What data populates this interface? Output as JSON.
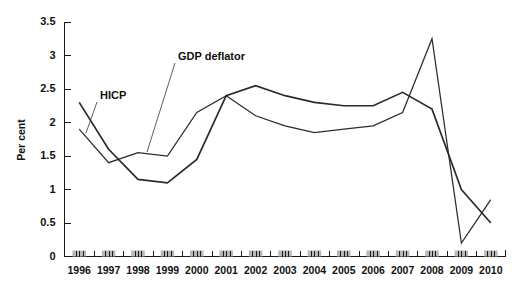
{
  "chart_data": {
    "type": "line",
    "title": "",
    "xlabel": "",
    "ylabel": "Per cent",
    "ylim": [
      0,
      3.5
    ],
    "yticks": [
      "0",
      "0.5",
      "1",
      "1.5",
      "2",
      "2.5",
      "3",
      "3.5"
    ],
    "ytick_values": [
      0,
      0.5,
      1,
      1.5,
      2,
      2.5,
      3,
      3.5
    ],
    "grid": false,
    "legend_position": "inline-annotations",
    "categories": [
      "1996",
      "1997",
      "1998",
      "1999",
      "2000",
      "2001",
      "2002",
      "2003",
      "2004",
      "2005",
      "2006",
      "2007",
      "2008",
      "2009",
      "2010"
    ],
    "series": [
      {
        "name": "HICP",
        "values": [
          2.3,
          1.6,
          1.15,
          1.1,
          1.45,
          2.4,
          2.55,
          2.4,
          2.3,
          2.25,
          2.25,
          2.45,
          2.2,
          1.0,
          0.5
        ]
      },
      {
        "name": "GDP deflator",
        "values": [
          1.9,
          1.4,
          1.55,
          1.5,
          2.15,
          2.4,
          2.1,
          1.95,
          1.85,
          1.9,
          1.95,
          2.15,
          3.25,
          0.2,
          0.85
        ]
      }
    ],
    "annotations": [
      {
        "label": "HICP",
        "text_x": 100,
        "text_y": 99,
        "leader_from_x": 97,
        "leader_from_y": 102,
        "leader_to_x": 86,
        "leader_to_y": 133
      },
      {
        "label": "GDP deflator",
        "text_x": 178,
        "text_y": 60,
        "leader_from_x": 175,
        "leader_from_y": 63,
        "leader_to_x": 147,
        "leader_to_y": 152
      }
    ]
  },
  "axes": {
    "y_axis_title": "Per cent"
  }
}
